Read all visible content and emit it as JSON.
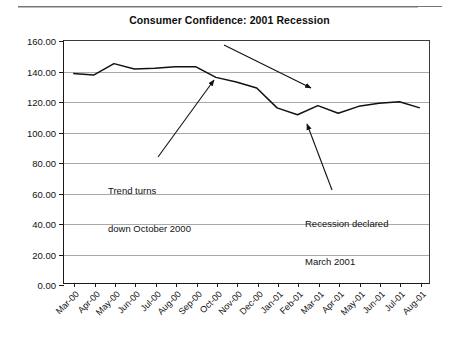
{
  "page": {
    "top_rule": "horizontal-rule"
  },
  "chart_data": {
    "type": "line",
    "title": "Consumer Confidence: 2001 Recession",
    "xlabel": "",
    "ylabel": "",
    "ylim": [
      0,
      160
    ],
    "ytick_step": 20,
    "grid": true,
    "legend": "none",
    "categories": [
      "Mar-00",
      "Apr-00",
      "May-00",
      "Jun-00",
      "Jul-00",
      "Aug-00",
      "Sep-00",
      "Oct-00",
      "Nov-00",
      "Dec-00",
      "Jan-01",
      "Feb-01",
      "Mar-01",
      "Apr-01",
      "May-01",
      "Jun-01",
      "Jul-01",
      "Aug-01"
    ],
    "ytick_labels": [
      "0.00",
      "20.00",
      "40.00",
      "60.00",
      "80.00",
      "100.00",
      "120.00",
      "140.00",
      "160.00"
    ],
    "values": [
      138.0,
      137.0,
      144.5,
      141.0,
      141.5,
      142.5,
      142.5,
      135.5,
      132.5,
      128.5,
      115.5,
      111.0,
      117.0,
      112.0,
      116.5,
      118.5,
      119.5,
      115.5
    ],
    "series": [
      {
        "name": "Consumer Confidence",
        "values": [
          138.0,
          137.0,
          144.5,
          141.0,
          141.5,
          142.5,
          142.5,
          135.5,
          132.5,
          128.5,
          115.5,
          111.0,
          117.0,
          112.0,
          116.5,
          118.5,
          119.5,
          115.5
        ]
      }
    ],
    "annotations": [
      {
        "name": "downturn-arrow",
        "text": "",
        "arrow": {
          "x1": 224,
          "y1": 45,
          "x2": 311,
          "y2": 88
        }
      },
      {
        "name": "trend-turns-note",
        "text": "Trend turns\ndown October 2000",
        "line1": "Trend turns",
        "line2": "down October 2000",
        "arrow": {
          "x1": 158,
          "y1": 157,
          "x2": 214,
          "y2": 80
        }
      },
      {
        "name": "recession-declared-note",
        "text": "Recession declared\nMarch 2001",
        "line1": "Recession declared",
        "line2": "March 2001",
        "arrow": {
          "x1": 332,
          "y1": 190,
          "x2": 307,
          "y2": 124
        }
      }
    ],
    "style": {
      "line_color": "#111111",
      "grid_color": "#a9a9a9",
      "axis_color": "#1a1a1a",
      "background": "#ffffff"
    }
  }
}
